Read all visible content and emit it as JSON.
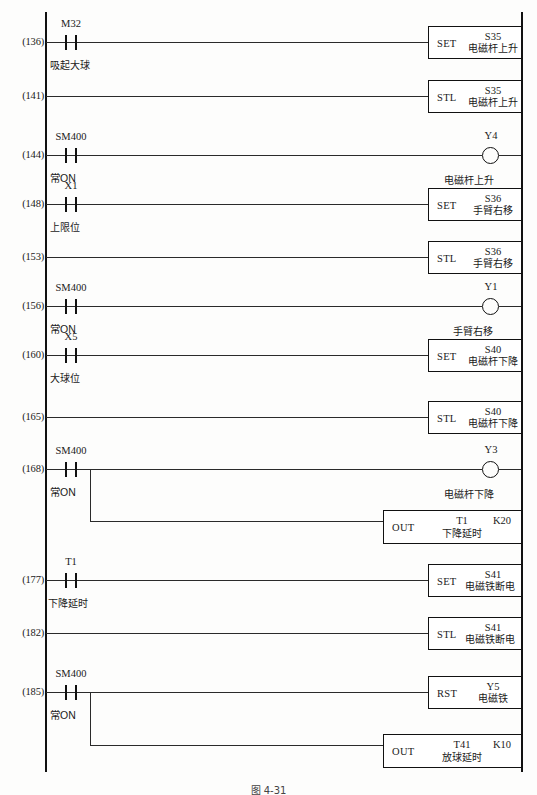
{
  "diagram": {
    "type": "plc-ladder-logic",
    "caption": "图 4-31",
    "rails": {
      "left_label": "left-power-rail",
      "right_label": "right-power-rail"
    },
    "rungs": [
      {
        "number": "(136)",
        "contact": {
          "name": "M32",
          "note": "吸起大球",
          "type": "NO"
        },
        "output": {
          "kind": "box",
          "op": "SET",
          "operand": "S35",
          "operand_note": "电磁杆上升"
        }
      },
      {
        "number": "(141)",
        "contact": null,
        "output": {
          "kind": "box",
          "op": "STL",
          "operand": "S35",
          "operand_note": "电磁杆上升"
        }
      },
      {
        "number": "(144)",
        "contact": {
          "name": "SM400",
          "note": "常ON",
          "type": "NO"
        },
        "output": {
          "kind": "coil",
          "operand": "Y4",
          "operand_note": "电磁杆上升"
        }
      },
      {
        "number": "(148)",
        "contact": {
          "name": "X1",
          "note": "上限位",
          "type": "NO"
        },
        "output": {
          "kind": "box",
          "op": "SET",
          "operand": "S36",
          "operand_note": "手臂右移"
        }
      },
      {
        "number": "(153)",
        "contact": null,
        "output": {
          "kind": "box",
          "op": "STL",
          "operand": "S36",
          "operand_note": "手臂右移"
        }
      },
      {
        "number": "(156)",
        "contact": {
          "name": "SM400",
          "note": "常ON",
          "type": "NO"
        },
        "output": {
          "kind": "coil",
          "operand": "Y1",
          "operand_note": "手臂右移"
        }
      },
      {
        "number": "(160)",
        "contact": {
          "name": "X5",
          "note": "大球位",
          "type": "NO"
        },
        "output": {
          "kind": "box",
          "op": "SET",
          "operand": "S40",
          "operand_note": "电磁杆下降"
        }
      },
      {
        "number": "(165)",
        "contact": null,
        "output": {
          "kind": "box",
          "op": "STL",
          "operand": "S40",
          "operand_note": "电磁杆下降"
        }
      },
      {
        "number": "(168)",
        "contact": {
          "name": "SM400",
          "note": "常ON",
          "type": "NO"
        },
        "branched": true,
        "output": {
          "kind": "coil",
          "operand": "Y3",
          "operand_note": "电磁杆下降"
        },
        "branch_output": {
          "kind": "box",
          "op": "OUT",
          "operand": "T1",
          "operand_note": "下降延时",
          "kvalue": "K20"
        }
      },
      {
        "number": "(177)",
        "contact": {
          "name": "T1",
          "note": "下降延时",
          "type": "NO"
        },
        "output": {
          "kind": "box",
          "op": "SET",
          "operand": "S41",
          "operand_note": "电磁铁断电"
        }
      },
      {
        "number": "(182)",
        "contact": null,
        "output": {
          "kind": "box",
          "op": "STL",
          "operand": "S41",
          "operand_note": "电磁铁断电"
        }
      },
      {
        "number": "(185)",
        "contact": {
          "name": "SM400",
          "note": "常ON",
          "type": "NO"
        },
        "branched": true,
        "output": {
          "kind": "box",
          "op": "RST",
          "operand": "Y5",
          "operand_note": "电磁铁"
        },
        "branch_output": {
          "kind": "box",
          "op": "OUT",
          "operand": "T41",
          "operand_note": "放球延时",
          "kvalue": "K10"
        }
      }
    ]
  }
}
